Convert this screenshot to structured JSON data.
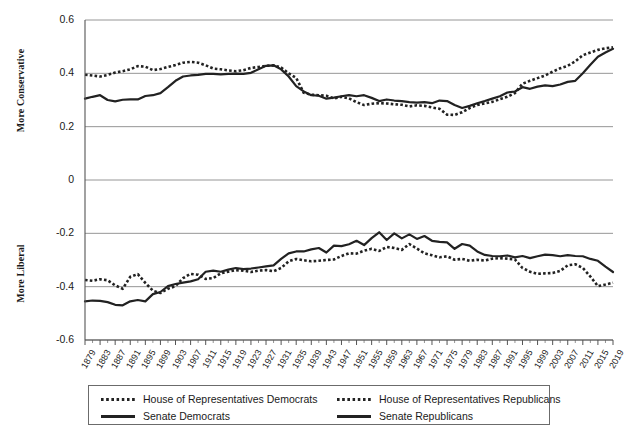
{
  "chart_data": {
    "type": "line",
    "title": "",
    "xlabel": "",
    "ylabel": "",
    "ylim": [
      -0.6,
      0.6
    ],
    "yticks": [
      "0.6",
      "0.4",
      "0.2",
      "0",
      "-0.2",
      "-0.4",
      "-0.6"
    ],
    "ytick_values": [
      0.6,
      0.4,
      0.2,
      0,
      -0.2,
      -0.4,
      -0.6
    ],
    "y_axis_upper_label": "More Conservative",
    "y_axis_lower_label": "More Liberal",
    "grid": true,
    "grid_orientation": "horizontal",
    "legend_position": "bottom",
    "x_tick_labels": [
      "1879",
      "1883",
      "1887",
      "1891",
      "1895",
      "1899",
      "1903",
      "1907",
      "1911",
      "1915",
      "1919",
      "1923",
      "1927",
      "1931",
      "1935",
      "1939",
      "1943",
      "1947",
      "1951",
      "1955",
      "1959",
      "1963",
      "1967",
      "1971",
      "1975",
      "1979",
      "1983",
      "1987",
      "1991",
      "1995",
      "1999",
      "2003",
      "2007",
      "2011",
      "2015",
      "2019"
    ],
    "x": [
      1879,
      1881,
      1883,
      1885,
      1887,
      1889,
      1891,
      1893,
      1895,
      1897,
      1899,
      1901,
      1903,
      1905,
      1907,
      1909,
      1911,
      1913,
      1915,
      1917,
      1919,
      1921,
      1923,
      1925,
      1927,
      1929,
      1931,
      1933,
      1935,
      1937,
      1939,
      1941,
      1943,
      1945,
      1947,
      1949,
      1951,
      1953,
      1955,
      1957,
      1959,
      1961,
      1963,
      1965,
      1967,
      1969,
      1971,
      1973,
      1975,
      1977,
      1979,
      1981,
      1983,
      1985,
      1987,
      1989,
      1991,
      1993,
      1995,
      1997,
      1999,
      2001,
      2003,
      2005,
      2007,
      2009,
      2011,
      2013,
      2015,
      2017,
      2019
    ],
    "series": [
      {
        "name": "House of Representatives Democrats",
        "style": "dotted",
        "color": "#222222",
        "values": [
          -0.375,
          -0.378,
          -0.372,
          -0.376,
          -0.395,
          -0.408,
          -0.363,
          -0.353,
          -0.386,
          -0.415,
          -0.424,
          -0.408,
          -0.398,
          -0.368,
          -0.352,
          -0.355,
          -0.371,
          -0.368,
          -0.35,
          -0.344,
          -0.338,
          -0.34,
          -0.345,
          -0.34,
          -0.338,
          -0.342,
          -0.33,
          -0.305,
          -0.296,
          -0.301,
          -0.305,
          -0.303,
          -0.3,
          -0.298,
          -0.285,
          -0.275,
          -0.276,
          -0.265,
          -0.258,
          -0.266,
          -0.251,
          -0.255,
          -0.262,
          -0.24,
          -0.257,
          -0.275,
          -0.282,
          -0.29,
          -0.286,
          -0.299,
          -0.296,
          -0.303,
          -0.299,
          -0.302,
          -0.295,
          -0.293,
          -0.295,
          -0.298,
          -0.33,
          -0.344,
          -0.352,
          -0.35,
          -0.349,
          -0.341,
          -0.32,
          -0.316,
          -0.33,
          -0.362,
          -0.398,
          -0.392,
          -0.385
        ]
      },
      {
        "name": "House of Representatives Republicans",
        "style": "dotted",
        "color": "#222222",
        "values": [
          0.395,
          0.392,
          0.388,
          0.394,
          0.403,
          0.408,
          0.415,
          0.427,
          0.425,
          0.412,
          0.416,
          0.424,
          0.431,
          0.44,
          0.443,
          0.44,
          0.43,
          0.418,
          0.415,
          0.411,
          0.408,
          0.412,
          0.42,
          0.424,
          0.428,
          0.43,
          0.422,
          0.4,
          0.383,
          0.327,
          0.32,
          0.318,
          0.316,
          0.306,
          0.312,
          0.306,
          0.292,
          0.281,
          0.286,
          0.288,
          0.287,
          0.284,
          0.282,
          0.276,
          0.28,
          0.278,
          0.272,
          0.267,
          0.245,
          0.244,
          0.254,
          0.27,
          0.281,
          0.287,
          0.293,
          0.303,
          0.312,
          0.326,
          0.361,
          0.372,
          0.382,
          0.392,
          0.406,
          0.419,
          0.428,
          0.445,
          0.468,
          0.478,
          0.488,
          0.494,
          0.498
        ]
      },
      {
        "name": "Senate Democrats",
        "style": "solid",
        "color": "#222222",
        "values": [
          -0.455,
          -0.452,
          -0.453,
          -0.458,
          -0.468,
          -0.47,
          -0.455,
          -0.45,
          -0.455,
          -0.428,
          -0.42,
          -0.398,
          -0.39,
          -0.385,
          -0.38,
          -0.372,
          -0.344,
          -0.34,
          -0.344,
          -0.336,
          -0.33,
          -0.334,
          -0.332,
          -0.328,
          -0.324,
          -0.32,
          -0.296,
          -0.275,
          -0.268,
          -0.268,
          -0.26,
          -0.255,
          -0.272,
          -0.246,
          -0.248,
          -0.241,
          -0.228,
          -0.244,
          -0.218,
          -0.196,
          -0.225,
          -0.2,
          -0.219,
          -0.204,
          -0.221,
          -0.21,
          -0.228,
          -0.232,
          -0.234,
          -0.258,
          -0.24,
          -0.246,
          -0.268,
          -0.281,
          -0.285,
          -0.286,
          -0.283,
          -0.29,
          -0.285,
          -0.293,
          -0.286,
          -0.28,
          -0.282,
          -0.286,
          -0.282,
          -0.285,
          -0.286,
          -0.296,
          -0.303,
          -0.325,
          -0.345
        ]
      },
      {
        "name": "Senate Republicans",
        "style": "solid",
        "color": "#222222",
        "values": [
          0.305,
          0.312,
          0.318,
          0.3,
          0.295,
          0.301,
          0.302,
          0.302,
          0.315,
          0.318,
          0.326,
          0.348,
          0.372,
          0.388,
          0.392,
          0.394,
          0.398,
          0.398,
          0.396,
          0.398,
          0.399,
          0.398,
          0.402,
          0.415,
          0.428,
          0.43,
          0.415,
          0.388,
          0.352,
          0.332,
          0.318,
          0.316,
          0.305,
          0.309,
          0.314,
          0.318,
          0.314,
          0.318,
          0.308,
          0.296,
          0.302,
          0.298,
          0.296,
          0.292,
          0.29,
          0.292,
          0.288,
          0.298,
          0.296,
          0.281,
          0.27,
          0.278,
          0.288,
          0.296,
          0.305,
          0.314,
          0.328,
          0.332,
          0.348,
          0.342,
          0.35,
          0.355,
          0.352,
          0.358,
          0.368,
          0.372,
          0.4,
          0.432,
          0.462,
          0.478,
          0.492
        ]
      }
    ]
  },
  "legend": {
    "entries": [
      {
        "label": "House of Representatives Democrats",
        "style": "dotted"
      },
      {
        "label": "House of Representatives Republicans",
        "style": "dotted"
      },
      {
        "label": "Senate Democrats",
        "style": "solid"
      },
      {
        "label": "Senate Republicans",
        "style": "solid"
      }
    ]
  }
}
